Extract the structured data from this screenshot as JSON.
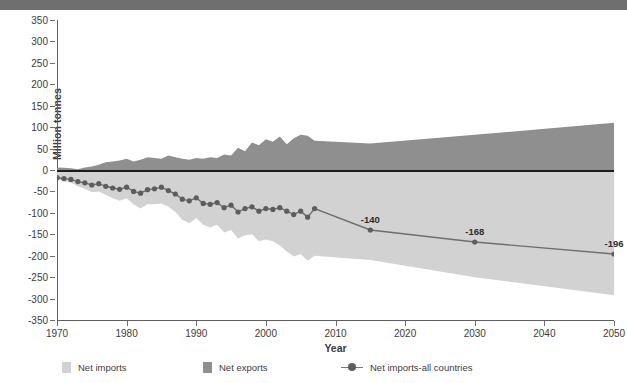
{
  "header": {
    "bar_color": "#6f6f6f"
  },
  "axes": {
    "ylabel": "Million tonnes",
    "xlabel": "Year",
    "yticks": [
      350,
      300,
      250,
      200,
      150,
      100,
      50,
      0,
      -50,
      -100,
      -150,
      -200,
      -250,
      -300,
      -350
    ],
    "xticks": [
      1970,
      1980,
      1990,
      2000,
      2010,
      2020,
      2030,
      2040,
      2050
    ],
    "ylim": [
      -350,
      350
    ],
    "xlim": [
      1970,
      2050
    ]
  },
  "legend": [
    {
      "label": "Net imports",
      "color": "#d2d2d2",
      "marker": "square"
    },
    {
      "label": "Net exports",
      "color": "#8f8f8f",
      "marker": "square"
    },
    {
      "label": "Net imports-all countries",
      "color": "#777777",
      "marker": "line-dot"
    }
  ],
  "colors": {
    "net_imports_band": "#d2d2d2",
    "net_exports_band": "#8f8f8f",
    "line": "#6e6e6e",
    "marker": "#5d5d5d",
    "zero_line": "#1c1c1c",
    "axis": "#5f5f5f",
    "text": "#3b3b3b"
  },
  "data_labels": [
    {
      "x": 2015,
      "y": -140,
      "text": "-140"
    },
    {
      "x": 2030,
      "y": -168,
      "text": "-168"
    },
    {
      "x": 2050,
      "y": -196,
      "text": "-196"
    }
  ],
  "chart_data": {
    "type": "area",
    "xlabel": "Year",
    "ylabel": "Million tonnes",
    "xlim": [
      1970,
      2050
    ],
    "ylim": [
      -350,
      350
    ],
    "grid": false,
    "legend_position": "bottom",
    "x": [
      1970,
      1971,
      1972,
      1973,
      1974,
      1975,
      1976,
      1977,
      1978,
      1979,
      1980,
      1981,
      1982,
      1983,
      1984,
      1985,
      1986,
      1987,
      1988,
      1989,
      1990,
      1991,
      1992,
      1993,
      1994,
      1995,
      1996,
      1997,
      1998,
      1999,
      2000,
      2001,
      2002,
      2003,
      2004,
      2005,
      2006,
      2007,
      2015,
      2030,
      2050
    ],
    "series": [
      {
        "name": "Net imports-all countries",
        "type": "line",
        "values": [
          -18,
          -20,
          -22,
          -27,
          -30,
          -35,
          -32,
          -38,
          -42,
          -45,
          -40,
          -50,
          -54,
          -46,
          -44,
          -40,
          -48,
          -56,
          -68,
          -72,
          -65,
          -78,
          -80,
          -76,
          -88,
          -82,
          -98,
          -90,
          -86,
          -96,
          -90,
          -92,
          -88,
          -96,
          -104,
          -96,
          -110,
          -90,
          -140,
          -168,
          -196
        ]
      },
      {
        "name": "Net exports",
        "type": "area-upper",
        "values": [
          6,
          5,
          4,
          2,
          6,
          8,
          12,
          18,
          20,
          22,
          26,
          20,
          24,
          30,
          28,
          26,
          34,
          30,
          26,
          24,
          28,
          26,
          30,
          28,
          36,
          34,
          52,
          44,
          64,
          58,
          72,
          66,
          78,
          60,
          74,
          82,
          80,
          68,
          62,
          82,
          110
        ]
      },
      {
        "name": "Net imports",
        "type": "area-lower",
        "values": [
          -22,
          -26,
          -30,
          -38,
          -44,
          -52,
          -50,
          -58,
          -66,
          -72,
          -66,
          -80,
          -90,
          -80,
          -80,
          -78,
          -86,
          -98,
          -116,
          -124,
          -112,
          -128,
          -134,
          -128,
          -146,
          -140,
          -160,
          -152,
          -150,
          -166,
          -162,
          -166,
          -176,
          -190,
          -202,
          -196,
          -212,
          -200,
          -210,
          -250,
          -292
        ]
      }
    ]
  }
}
